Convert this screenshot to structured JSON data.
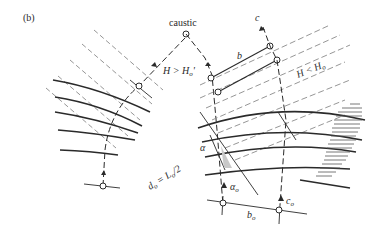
{
  "figure": {
    "panel_label": "(b)",
    "labels": {
      "caustic": "caustic",
      "h_greater": "H > H",
      "h_greater_sub": "o",
      "h_greater_suffix": "'",
      "h_less": "H < H",
      "h_less_sub": "o",
      "c": "c",
      "b": "b",
      "alpha": "α",
      "alpha0": "α",
      "alpha0_sub": "o",
      "d0_eq": "d",
      "d0_sub": "o",
      "d0_rhs": " = L",
      "d0_rhs_sub": "o",
      "d0_tail": "/2",
      "b0": "b",
      "b0_sub": "o",
      "c0": "c",
      "c0_sub": "o"
    },
    "colors": {
      "line": "#2a2a2a",
      "dashed": "#8a8a8a",
      "shade": "#c8c8c8"
    }
  }
}
